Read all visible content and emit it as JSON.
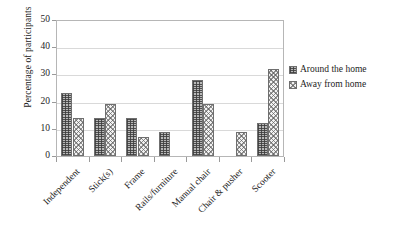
{
  "chart_data": {
    "type": "bar",
    "title": "",
    "xlabel": "",
    "ylabel": "Percentage of participants",
    "ylim": [
      0,
      50
    ],
    "yticks": [
      0,
      10,
      20,
      30,
      40,
      50
    ],
    "grid": true,
    "legend_position": "right",
    "categories": [
      "Independent",
      "Stick(s)",
      "Frame",
      "Rails/furniture",
      "Manual chair",
      "Chair & pusher",
      "Scooter"
    ],
    "series": [
      {
        "name": "Around the home",
        "pattern": "cross-hatch-grid",
        "color": "#b9b9b9",
        "values": [
          23,
          14,
          14,
          9,
          28,
          0,
          12
        ]
      },
      {
        "name": "Away from home",
        "pattern": "checkerboard",
        "color": "#f2f2f2",
        "values": [
          14,
          19,
          7,
          0,
          19,
          9,
          32
        ]
      }
    ]
  },
  "legend": {
    "items": [
      {
        "label": "Around the home"
      },
      {
        "label": "Away from home"
      }
    ]
  }
}
